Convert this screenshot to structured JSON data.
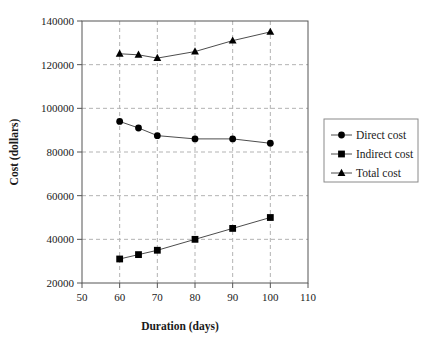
{
  "chart_data": {
    "type": "line",
    "title": "",
    "xlabel": "Duration (days)",
    "ylabel": "Cost (dollars)",
    "xlim": [
      50,
      110
    ],
    "ylim": [
      20000,
      140000
    ],
    "xticks": [
      50,
      60,
      70,
      80,
      90,
      100,
      110
    ],
    "yticks": [
      20000,
      40000,
      60000,
      80000,
      100000,
      120000,
      140000
    ],
    "xtick_labels": [
      "50",
      "60",
      "70",
      "80",
      "90",
      "100",
      "110"
    ],
    "ytick_labels": [
      "20000",
      "40000",
      "60000",
      "80000",
      "100000",
      "120000",
      "140000"
    ],
    "grid": "dashed-gray-both-axes",
    "legend_position": "right-outside",
    "x": [
      60,
      65,
      70,
      80,
      90,
      100
    ],
    "series": [
      {
        "name": "Direct cost",
        "marker": "circle",
        "color": "#000000",
        "values": [
          94000,
          91000,
          87500,
          86000,
          86000,
          84000
        ]
      },
      {
        "name": "Indirect cost",
        "marker": "square",
        "color": "#000000",
        "values": [
          31000,
          33000,
          35000,
          40000,
          45000,
          50000
        ]
      },
      {
        "name": "Total cost",
        "marker": "triangle",
        "color": "#000000",
        "values": [
          125000,
          124500,
          123000,
          126000,
          131000,
          135000
        ]
      }
    ]
  },
  "legend": {
    "items": [
      {
        "label": "Direct cost",
        "marker": "circle"
      },
      {
        "label": "Indirect cost",
        "marker": "square"
      },
      {
        "label": "Total cost",
        "marker": "triangle"
      }
    ]
  }
}
